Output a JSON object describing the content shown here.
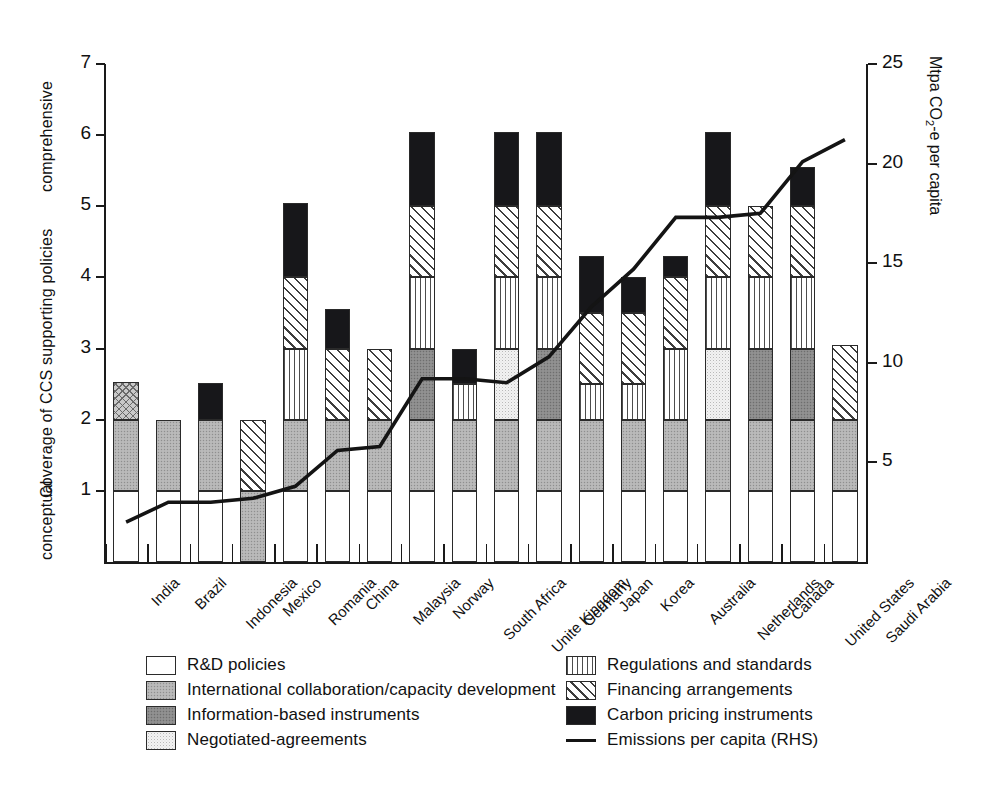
{
  "chart_data": {
    "type": "bar",
    "title": "",
    "xlabel": "",
    "ylabel": "Coverage of CCS supporting policies",
    "ylabel_low": "conceptual",
    "ylabel_high": "comprehensive",
    "y2label": "Mtpa CO₂-e per capita",
    "ylim": [
      0,
      7
    ],
    "y2lim": [
      0,
      25
    ],
    "yticks": [
      1,
      2,
      3,
      4,
      5,
      6,
      7
    ],
    "y2ticks": [
      5,
      10,
      15,
      20,
      25
    ],
    "grid": false,
    "legend_position": "below",
    "stacked": true,
    "categories": [
      "India",
      "Brazil",
      "Indonesia",
      "Mexico",
      "Romania",
      "China",
      "Malaysia",
      "Norway",
      "South Africa",
      "Unite Kingdom",
      "Germany",
      "Japan",
      "Korea",
      "Australia",
      "Netherlands",
      "Canada",
      "United States",
      "Saudi Arabia"
    ],
    "series": [
      {
        "name": "R&D policies",
        "key": "rd",
        "fill": "f-rd",
        "values": [
          1,
          1,
          1,
          0,
          1,
          1,
          1,
          1,
          1,
          1,
          1,
          1,
          1,
          1,
          1,
          1,
          1,
          1
        ]
      },
      {
        "name": "International collaboration/capacity development",
        "key": "intl",
        "fill": "f-intl",
        "values": [
          1,
          1,
          1,
          1,
          1,
          1,
          1,
          1,
          1,
          1,
          1,
          1,
          1,
          1,
          1,
          1,
          1,
          1
        ]
      },
      {
        "name": "Information-based instruments",
        "key": "info",
        "fill": "f-info",
        "values": [
          0,
          0,
          0,
          0,
          0,
          0,
          0,
          1,
          0,
          0,
          1,
          0,
          0,
          0,
          0,
          1,
          1,
          0
        ]
      },
      {
        "name": "Negotiated-agreements",
        "key": "nego",
        "fill": "f-nego",
        "values": [
          0,
          0,
          0,
          0,
          0,
          0,
          0,
          0,
          0,
          1,
          0,
          0,
          0,
          0,
          1,
          0,
          0,
          0
        ]
      },
      {
        "name": "Regulations and standards",
        "key": "reg",
        "fill": "f-reg",
        "values": [
          0,
          0,
          0,
          0,
          1,
          0,
          0,
          1,
          0.5,
          1,
          1,
          0.5,
          0.5,
          1,
          1,
          1,
          1,
          0
        ]
      },
      {
        "name": "Financing arrangements",
        "key": "fin",
        "fill": "f-fin",
        "values": [
          0.53,
          0,
          0,
          1,
          1,
          1,
          1,
          1,
          0,
          1,
          1,
          1,
          1,
          1,
          1,
          1,
          1,
          1.05
        ]
      },
      {
        "name": "Carbon pricing instruments",
        "key": "carb",
        "fill": "f-carb",
        "values": [
          0,
          0,
          0.52,
          0,
          1.05,
          0.55,
          0,
          1.05,
          0.5,
          1.05,
          1.05,
          0.8,
          0.5,
          0.3,
          1.05,
          0,
          0.55,
          0
        ]
      }
    ],
    "line_series": {
      "name": "Emissions per capita (RHS)",
      "axis": "right",
      "color": "#141414",
      "values": [
        2.0,
        3.0,
        3.0,
        3.2,
        3.8,
        5.6,
        5.8,
        9.2,
        9.2,
        9.0,
        10.3,
        12.8,
        14.7,
        17.3,
        17.3,
        17.5,
        20.1,
        21.2
      ]
    }
  },
  "axes": {
    "left_title": "Coverage of CCS supporting policies",
    "left_low": "conceptual",
    "left_high": "comprehensive",
    "right_title_parts": {
      "pre": "Mtpa CO",
      "sub": "2",
      "post": "-e per capita"
    }
  },
  "legend": {
    "left_column": [
      {
        "label": "R&D policies",
        "swatch": "f-rd",
        "name": "legend-swatch-rd"
      },
      {
        "label": "International collaboration/capacity development",
        "swatch": "f-intl",
        "name": "legend-swatch-intl"
      },
      {
        "label": "Information-based instruments",
        "swatch": "f-info",
        "name": "legend-swatch-info"
      },
      {
        "label": "Negotiated-agreements",
        "swatch": "f-nego",
        "name": "legend-swatch-nego"
      }
    ],
    "right_column": [
      {
        "label": "Regulations and standards",
        "swatch": "f-reg",
        "name": "legend-swatch-reg"
      },
      {
        "label": "Financing arrangements",
        "swatch": "f-fin",
        "name": "legend-swatch-fin"
      },
      {
        "label": "Carbon pricing instruments",
        "swatch": "f-carb",
        "name": "legend-swatch-carb"
      },
      {
        "label": "Emissions per capita (RHS)",
        "swatch": "line",
        "name": "legend-swatch-line"
      }
    ]
  }
}
